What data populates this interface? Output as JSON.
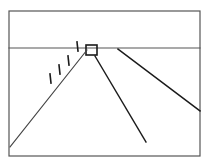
{
  "figure": {
    "background_color": "#ffffff",
    "ink_color": "#1a1a1a",
    "frame_color": "#555555",
    "canvas": {
      "width": 209,
      "height": 166
    }
  },
  "chart_data": {
    "type": "line",
    "xlabel": "",
    "ylabel": "",
    "xlim": [
      0,
      209
    ],
    "ylim": [
      0,
      166
    ],
    "grid": false,
    "legend": "none",
    "series": [
      {
        "name": "picture-frame-border",
        "kind": "rect",
        "x": 9,
        "y": 11,
        "width": 191,
        "height": 145,
        "stroke": "#555555",
        "stroke_width": 1.2
      },
      {
        "name": "horizon-line",
        "kind": "polyline",
        "points": [
          [
            9,
            48
          ],
          [
            200,
            48
          ]
        ],
        "stroke": "#555555",
        "stroke_width": 1.2
      },
      {
        "name": "vanishing-point-box",
        "kind": "rect",
        "x": 86,
        "y": 45,
        "width": 11,
        "height": 10,
        "stroke": "#1a1a1a",
        "stroke_width": 1.6
      },
      {
        "name": "receding-line-left",
        "kind": "polyline",
        "points": [
          [
            87,
            50
          ],
          [
            10,
            147
          ]
        ],
        "stroke": "#444444",
        "stroke_width": 1.1
      },
      {
        "name": "receding-line-center",
        "kind": "polyline",
        "points": [
          [
            95,
            56
          ],
          [
            146,
            142
          ]
        ],
        "stroke": "#1a1a1a",
        "stroke_width": 1.4
      },
      {
        "name": "receding-line-right",
        "kind": "polyline",
        "points": [
          [
            118,
            49
          ],
          [
            200,
            111
          ]
        ],
        "stroke": "#1a1a1a",
        "stroke_width": 1.5
      },
      {
        "name": "tick-mark-1",
        "kind": "polyline",
        "points": [
          [
            77,
            42
          ],
          [
            78,
            51
          ]
        ],
        "stroke": "#1a1a1a",
        "stroke_width": 1.6
      },
      {
        "name": "tick-mark-2",
        "kind": "polyline",
        "points": [
          [
            68,
            56
          ],
          [
            69,
            65
          ]
        ],
        "stroke": "#1a1a1a",
        "stroke_width": 1.6
      },
      {
        "name": "tick-mark-3",
        "kind": "polyline",
        "points": [
          [
            59,
            65
          ],
          [
            60,
            74
          ]
        ],
        "stroke": "#1a1a1a",
        "stroke_width": 1.6
      },
      {
        "name": "tick-mark-4",
        "kind": "polyline",
        "points": [
          [
            50,
            74
          ],
          [
            51,
            83
          ]
        ],
        "stroke": "#1a1a1a",
        "stroke_width": 1.6
      }
    ],
    "annotations": []
  }
}
